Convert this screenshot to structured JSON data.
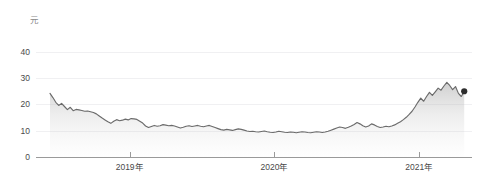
{
  "chart_data": {
    "type": "line",
    "title": "",
    "subtitle": "",
    "xlabel": "",
    "ylabel": "元",
    "unit_label": "元",
    "grid": true,
    "legend": false,
    "legend_position": "none",
    "xlim": [
      2018.45,
      2021.35
    ],
    "ylim": [
      0,
      44
    ],
    "y_ticks": [
      0,
      10,
      20,
      30,
      40
    ],
    "y_tick_labels": [
      "0",
      "10",
      "20",
      "30",
      "40"
    ],
    "x_ticks": [
      2019,
      2020,
      2021
    ],
    "x_tick_labels": [
      "2019年",
      "2020年",
      "2021年"
    ],
    "series": [
      {
        "name": "股价",
        "color": "#6b6b6b",
        "fill_color": "#b8b8b8",
        "end_marker": true,
        "end_marker_color": "#2e2e2e",
        "end_value": 25.0,
        "x": [
          2018.45,
          2018.47,
          2018.49,
          2018.51,
          2018.53,
          2018.55,
          2018.57,
          2018.59,
          2018.61,
          2018.63,
          2018.65,
          2018.67,
          2018.69,
          2018.71,
          2018.73,
          2018.75,
          2018.77,
          2018.79,
          2018.81,
          2018.83,
          2018.85,
          2018.87,
          2018.89,
          2018.91,
          2018.93,
          2018.95,
          2018.97,
          2018.99,
          2019.01,
          2019.03,
          2019.05,
          2019.07,
          2019.09,
          2019.11,
          2019.13,
          2019.15,
          2019.17,
          2019.19,
          2019.21,
          2019.23,
          2019.25,
          2019.27,
          2019.29,
          2019.31,
          2019.33,
          2019.35,
          2019.37,
          2019.39,
          2019.41,
          2019.43,
          2019.45,
          2019.47,
          2019.49,
          2019.51,
          2019.53,
          2019.55,
          2019.57,
          2019.59,
          2019.61,
          2019.63,
          2019.65,
          2019.67,
          2019.69,
          2019.71,
          2019.73,
          2019.75,
          2019.77,
          2019.79,
          2019.81,
          2019.83,
          2019.85,
          2019.87,
          2019.89,
          2019.91,
          2019.93,
          2019.95,
          2019.97,
          2019.99,
          2020.01,
          2020.03,
          2020.05,
          2020.07,
          2020.09,
          2020.11,
          2020.13,
          2020.15,
          2020.17,
          2020.19,
          2020.21,
          2020.23,
          2020.25,
          2020.27,
          2020.29,
          2020.31,
          2020.33,
          2020.35,
          2020.37,
          2020.39,
          2020.41,
          2020.43,
          2020.45,
          2020.47,
          2020.49,
          2020.51,
          2020.53,
          2020.55,
          2020.57,
          2020.59,
          2020.61,
          2020.63,
          2020.65,
          2020.67,
          2020.69,
          2020.71,
          2020.73,
          2020.75,
          2020.77,
          2020.79,
          2020.81,
          2020.83,
          2020.85,
          2020.87,
          2020.89,
          2020.91,
          2020.93,
          2020.95,
          2020.97,
          2020.99,
          2021.01,
          2021.03,
          2021.05,
          2021.07,
          2021.09,
          2021.11,
          2021.13,
          2021.15,
          2021.17,
          2021.19,
          2021.21,
          2021.23,
          2021.25,
          2021.27,
          2021.29,
          2021.31
        ],
        "values": [
          24.2,
          22.6,
          20.8,
          19.6,
          20.4,
          19.2,
          18.0,
          18.9,
          17.6,
          18.1,
          17.9,
          17.7,
          17.4,
          17.5,
          17.2,
          16.9,
          16.4,
          15.6,
          14.8,
          14.1,
          13.4,
          12.8,
          13.6,
          14.2,
          13.8,
          14.0,
          14.4,
          14.1,
          14.6,
          14.5,
          14.3,
          13.6,
          12.9,
          11.8,
          11.2,
          11.6,
          12.0,
          11.7,
          11.9,
          12.3,
          12.1,
          11.9,
          12.0,
          11.8,
          11.4,
          11.0,
          11.3,
          11.7,
          11.9,
          11.6,
          11.8,
          12.0,
          11.7,
          11.5,
          11.8,
          12.0,
          11.6,
          11.2,
          10.8,
          10.4,
          10.2,
          10.5,
          10.3,
          10.1,
          10.4,
          10.7,
          10.5,
          10.2,
          9.9,
          9.7,
          9.8,
          9.6,
          9.5,
          9.7,
          9.9,
          9.6,
          9.4,
          9.3,
          9.5,
          9.8,
          9.6,
          9.4,
          9.3,
          9.5,
          9.4,
          9.2,
          9.4,
          9.6,
          9.5,
          9.3,
          9.2,
          9.4,
          9.6,
          9.5,
          9.3,
          9.5,
          9.8,
          10.2,
          10.6,
          11.0,
          11.4,
          11.2,
          10.9,
          11.3,
          11.8,
          12.4,
          13.1,
          12.6,
          11.9,
          11.4,
          11.8,
          12.6,
          12.2,
          11.6,
          11.2,
          11.4,
          11.7,
          11.5,
          11.8,
          12.2,
          12.8,
          13.4,
          14.2,
          15.1,
          16.2,
          17.4,
          19.0,
          20.8,
          22.4,
          21.2,
          23.0,
          24.6,
          23.4,
          24.8,
          26.2,
          25.4,
          27.0,
          28.4,
          27.2,
          25.6,
          26.8,
          24.2,
          23.0,
          25.0
        ]
      }
    ]
  }
}
